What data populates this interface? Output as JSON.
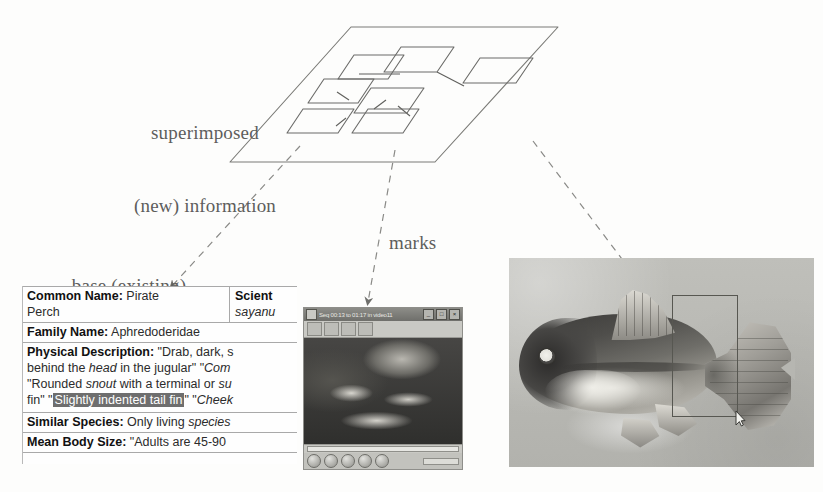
{
  "figure": {
    "labels": {
      "superimposed_line1": "superimposed",
      "superimposed_line2": "(new) information",
      "base_line1": "base (existing)",
      "base_line2": "information",
      "marks": "marks"
    }
  },
  "document": {
    "name": "species-fact-sheet",
    "rows": [
      {
        "id": "common-name",
        "label": "Common Name:",
        "value": " Pirate",
        "value2": "Perch",
        "sci_label": "Scient",
        "sci_value": "sayanu"
      },
      {
        "id": "family-name",
        "label": "Family Name:",
        "value": " Aphredoderidae"
      },
      {
        "id": "physical-description",
        "label": "Physical Description:",
        "value": " \"Drab, dark, s",
        "line2_a": "behind the ",
        "line2_i": "head",
        "line2_b": " in the jugular\" \"",
        "line2_i2": "Com",
        "line3_a": "\"Rounded ",
        "line3_i": "snout",
        "line3_b": " with a terminal or ",
        "line3_i2": "su",
        "line4_a": "fin\" \"",
        "line4_hl": "Slightly indented tail fin",
        "line4_b": "\" \"",
        "line4_i": "Cheek"
      },
      {
        "id": "similar-species",
        "label": "Similar Species:",
        "value": " Only living ",
        "value_i": "species"
      },
      {
        "id": "mean-body-size",
        "label": "Mean Body Size:",
        "value": " \"Adults are 45-90"
      }
    ]
  },
  "player": {
    "name": "video-player-window",
    "title": "Seq 00:13 to 01:17 in video11",
    "buttons": {
      "minimize": "_",
      "maximize": "□",
      "close": "×"
    },
    "toolbar_tools": [
      "open-tool",
      "record-tool",
      "annotate-tool",
      "list-tool"
    ],
    "transport": [
      "play-button",
      "pause-button",
      "stop-button",
      "prev-button",
      "next-button"
    ]
  },
  "photo": {
    "name": "fish-photograph",
    "subject": "Pirate Perch specimen",
    "selection_label": "tail-fin-selection",
    "cursor_label": "mouse-cursor"
  },
  "plane": {
    "name": "superimposed-layer-plane",
    "node_count": 6
  },
  "colors": {
    "background": "#fdfdfc",
    "label_text": "#5e5e5c",
    "line": "#6b6b68",
    "highlight_bg": "#6e6e6e",
    "highlight_text": "#ffffff",
    "photo_bg": "#b9b9b4",
    "player_chrome": "#c9c9c4"
  }
}
